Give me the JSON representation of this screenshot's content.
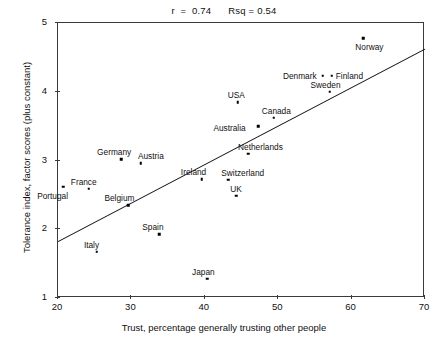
{
  "chart_data": {
    "type": "scatter",
    "title": "r  =  0.74      Rsq = 0.54",
    "stats": {
      "r_label": "r  =  0.74",
      "rsq_label": "Rsq = 0.54",
      "r": 0.74,
      "rsq": 0.54
    },
    "xlabel": "Trust, percentage generally trusting other people",
    "ylabel": "Tolerance index, factor scores (plus constant)",
    "xlim": [
      20,
      70
    ],
    "ylim": [
      1,
      5
    ],
    "xticks": [
      20,
      30,
      40,
      50,
      60,
      70
    ],
    "yticks": [
      1,
      2,
      3,
      4,
      5
    ],
    "xticklabels": [
      "20",
      "30",
      "40",
      "50",
      "60",
      "70"
    ],
    "yticklabels": [
      "1",
      "2",
      "3",
      "4",
      "5"
    ],
    "grid": false,
    "legend": false,
    "points": [
      {
        "label": "Portugal",
        "x": 20.7,
        "y": 2.62,
        "label_dx": -26,
        "label_dy": 9
      },
      {
        "label": "France",
        "x": 24.2,
        "y": 2.59,
        "label_dx": -18,
        "label_dy": -7
      },
      {
        "label": "Italy",
        "x": 25.3,
        "y": 1.67,
        "label_dx": -13,
        "label_dy": -7
      },
      {
        "label": "Germany",
        "x": 28.6,
        "y": 3.02,
        "label_dx": -24,
        "label_dy": -7
      },
      {
        "label": "Belgium",
        "x": 29.6,
        "y": 2.35,
        "label_dx": -24,
        "label_dy": -7
      },
      {
        "label": "Austria",
        "x": 31.3,
        "y": 2.96,
        "label_dx": -3,
        "label_dy": -7
      },
      {
        "label": "Spain",
        "x": 33.8,
        "y": 1.93,
        "label_dx": -17,
        "label_dy": -7
      },
      {
        "label": "Ireland",
        "x": 39.6,
        "y": 2.73,
        "label_dx": -21,
        "label_dy": -7
      },
      {
        "label": "Japan",
        "x": 40.3,
        "y": 1.28,
        "label_dx": -15,
        "label_dy": -7
      },
      {
        "label": "Switzerland",
        "x": 43.2,
        "y": 2.72,
        "label_dx": -7,
        "label_dy": -7
      },
      {
        "label": "UK",
        "x": 44.3,
        "y": 2.49,
        "label_dx": -6,
        "label_dy": -7
      },
      {
        "label": "USA",
        "x": 44.5,
        "y": 3.85,
        "label_dx": -10,
        "label_dy": -7
      },
      {
        "label": "Netherlands",
        "x": 45.9,
        "y": 3.1,
        "label_dx": -10,
        "label_dy": -7
      },
      {
        "label": "Australia",
        "x": 47.3,
        "y": 3.5,
        "label_dx": -45,
        "label_dy": 2
      },
      {
        "label": "Canada",
        "x": 49.4,
        "y": 3.62,
        "label_dx": -12,
        "label_dy": -7
      },
      {
        "label": "Denmark",
        "x": 56.1,
        "y": 4.23,
        "label_dx": -40,
        "label_dy": 0
      },
      {
        "label": "Sweden",
        "x": 57.0,
        "y": 4.0,
        "label_dx": -19,
        "label_dy": -7
      },
      {
        "label": "Finland",
        "x": 57.3,
        "y": 4.23,
        "label_dx": 4,
        "label_dy": 0
      },
      {
        "label": "Norway",
        "x": 61.6,
        "y": 4.78,
        "label_dx": -8,
        "label_dy": 9
      }
    ],
    "fit_line": {
      "type": "linear-regression",
      "x_start": 20,
      "y_start": 1.82,
      "x_end": 70,
      "y_end": 4.62
    }
  }
}
